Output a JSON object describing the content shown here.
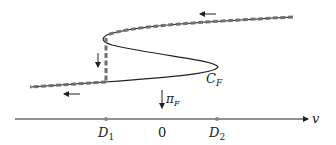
{
  "diagram": {
    "curve_label": "C",
    "curve_label_sub": "F",
    "projection_label": "π",
    "projection_label_sub": "F",
    "axis_label": "v",
    "axis_points": [
      {
        "label": "D",
        "sub": "1"
      },
      {
        "label": "0",
        "sub": ""
      },
      {
        "label": "D",
        "sub": "2"
      }
    ],
    "colors": {
      "curve": "#222222",
      "dashed_path": "#707070"
    }
  }
}
